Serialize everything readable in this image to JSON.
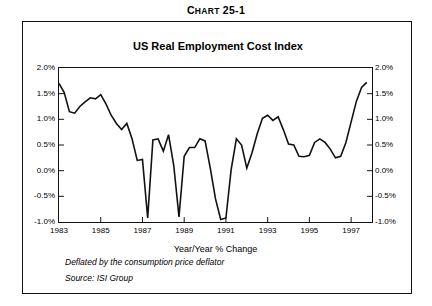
{
  "caption": {
    "prefix": "C",
    "small": "HART",
    "number": " 25-1",
    "full": "CHART 25-1"
  },
  "chart_title": "US Real Employment Cost Index",
  "xaxis_title": "Year/Year % Change",
  "footnotes": {
    "line1": "Deflated by the consumption price deflator",
    "line2": "Source: ISI Group"
  },
  "colors": {
    "line": "#111111",
    "frame": "#111111",
    "background": "#ffffff"
  },
  "chart_data": {
    "type": "line",
    "title": "US Real Employment Cost Index",
    "subtitle": "",
    "xlabel": "Year/Year % Change",
    "ylabel": "",
    "xlim": [
      1983.0,
      1998.0
    ],
    "ylim": [
      -1.0,
      2.0
    ],
    "yticks": [
      2.0,
      1.5,
      1.0,
      0.5,
      0.0,
      -0.5,
      -1.0
    ],
    "ytick_labels": [
      "2.0%",
      "1.5%",
      "1.0%",
      "0.5%",
      "0.0%",
      "-0.5%",
      "-1.0%"
    ],
    "xticks": [
      1983,
      1985,
      1987,
      1989,
      1991,
      1993,
      1995,
      1997
    ],
    "xtick_labels": [
      "1983",
      "1985",
      "1987",
      "1989",
      "1991",
      "1993",
      "1995",
      "1997"
    ],
    "grid": false,
    "legend": false,
    "units": "percent",
    "series": [
      {
        "name": "US Real Employment Cost Index (Year/Year % Change)",
        "x": [
          1983.0,
          1983.25,
          1983.5,
          1983.75,
          1984.0,
          1984.25,
          1984.5,
          1984.75,
          1985.0,
          1985.25,
          1985.5,
          1985.75,
          1986.0,
          1986.25,
          1986.5,
          1986.75,
          1987.0,
          1987.25,
          1987.5,
          1987.75,
          1988.0,
          1988.25,
          1988.5,
          1988.75,
          1989.0,
          1989.25,
          1989.5,
          1989.75,
          1990.0,
          1990.25,
          1990.5,
          1990.75,
          1991.0,
          1991.25,
          1991.5,
          1991.75,
          1992.0,
          1992.25,
          1992.5,
          1992.75,
          1993.0,
          1993.25,
          1993.5,
          1993.75,
          1994.0,
          1994.25,
          1994.5,
          1994.75,
          1995.0,
          1995.25,
          1995.5,
          1995.75,
          1996.0,
          1996.25,
          1996.5,
          1996.75,
          1997.0,
          1997.25,
          1997.5,
          1997.75
        ],
        "values": [
          1.7,
          1.52,
          1.15,
          1.12,
          1.25,
          1.34,
          1.42,
          1.4,
          1.48,
          1.3,
          1.08,
          0.92,
          0.8,
          0.92,
          0.62,
          0.2,
          0.22,
          -0.92,
          0.6,
          0.62,
          0.38,
          0.7,
          0.1,
          -0.9,
          0.28,
          0.45,
          0.45,
          0.62,
          0.58,
          0.05,
          -0.55,
          -0.95,
          -0.92,
          0.02,
          0.62,
          0.5,
          0.05,
          0.35,
          0.72,
          1.02,
          1.08,
          0.98,
          1.05,
          0.8,
          0.52,
          0.5,
          0.28,
          0.27,
          0.3,
          0.55,
          0.62,
          0.55,
          0.42,
          0.25,
          0.28,
          0.55,
          0.95,
          1.35,
          1.62,
          1.72
        ]
      }
    ],
    "annotations": [
      "Deflated by the consumption price deflator",
      "Source: ISI Group"
    ]
  }
}
